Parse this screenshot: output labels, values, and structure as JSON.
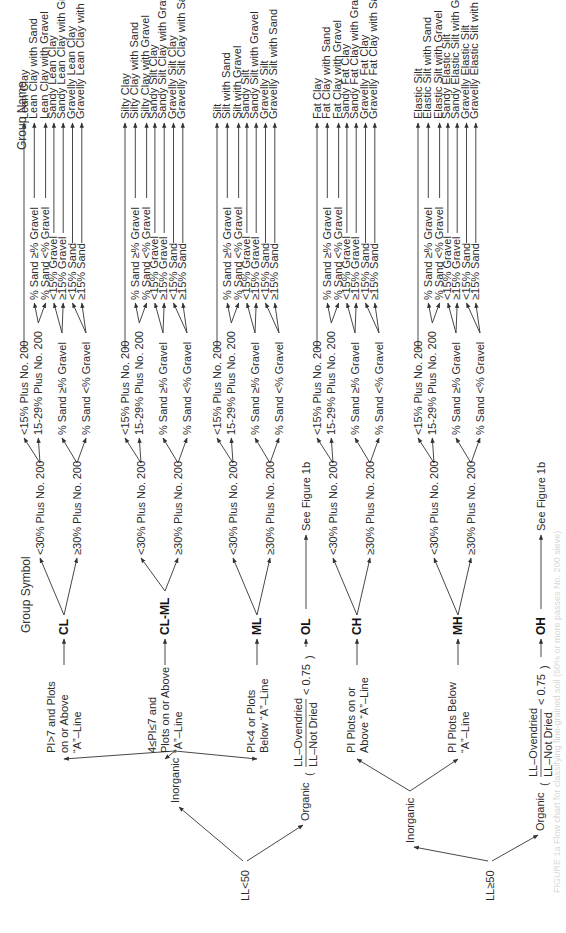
{
  "headers": {
    "group_symbol": "Group Symbol",
    "group_name": "Group Name"
  },
  "roots": [
    {
      "label": "LL<50",
      "inorganic_label": "Inorganic",
      "organic_label": "Organic",
      "organic_ratio_num": "LL–Ovendried",
      "organic_ratio_den": "LL–Not Dried",
      "organic_ratio_cmp": "< 0.75"
    },
    {
      "label": "LL≥50",
      "inorganic_label": "Inorganic",
      "organic_label": "Organic",
      "organic_ratio_num": "LL–Ovendried",
      "organic_ratio_den": "LL–Not Dried",
      "organic_ratio_cmp": "< 0.75"
    }
  ],
  "criteria": {
    "cl": [
      "PI>7 and Plots",
      "on or Above",
      "“A”–Line"
    ],
    "clml": [
      "4≤PI≤7 and",
      "Plots on or Above",
      "“A”–Line"
    ],
    "ml": [
      "PI<4 or Plots",
      "Below “A”–Line"
    ],
    "ch": [
      "PI Plots on or",
      "Above “A”–Line"
    ],
    "mh": [
      "PI Plots Below",
      "“A”–Line"
    ]
  },
  "symbols": {
    "cl": "CL",
    "clml": "CL-ML",
    "ml": "ML",
    "ol": "OL",
    "ch": "CH",
    "mh": "MH",
    "oh": "OH"
  },
  "see_figure": "See Figure 1b",
  "branch_labels": {
    "lt30": "<30% Plus No. 200",
    "ge30": "≥30% Plus No. 200",
    "lt15": "<15% Plus No. 200",
    "p15_29": "15-29% Plus No. 200",
    "sand_ge_gravel": "% Sand ≥% Gravel",
    "sand_lt_gravel": "% Sand <% Gravel",
    "lt15_gravel": "<15% Gravel",
    "ge15_gravel": "≥15% Gravel",
    "lt15_sand": "<15% Sand",
    "ge15_sand": "≥15% Sand"
  },
  "groups": [
    {
      "symbol": "CL",
      "names": [
        "Lean Clay",
        "Lean Clay with Sand",
        "Lean Clay with Gravel",
        "Sandy Lean Clay",
        "Sandy Lean Clay with Gravel",
        "Gravelly Lean Clay",
        "Gravelly Lean Clay with Sand"
      ]
    },
    {
      "symbol": "CL-ML",
      "names": [
        "Silty Clay",
        "Silty Clay with Sand",
        "Silty Clay with Gravel",
        "Sandy Silt Clay",
        "Sandy Silt Clay with Gravel",
        "Gravelly Silt Clay",
        "Gravelly Silt Clay with Sand"
      ]
    },
    {
      "symbol": "ML",
      "names": [
        "Silt",
        "Silt with Sand",
        "Silt with Gravel",
        "Sandy Silt",
        "Sandy Silt with Gravel",
        "Gravelly Silt",
        "Gravelly Silt with Sand"
      ]
    },
    {
      "symbol": "CH",
      "names": [
        "Fat Clay",
        "Fat Clay with Sand",
        "Fat Clay with Gravel",
        "Sandy Fat Clay",
        "Sandy Fat Clay with Gravel",
        "Gravelly Fat Clay",
        "Gravelly Fat Clay with Sand"
      ]
    },
    {
      "symbol": "MH",
      "names": [
        "Elastic Silt",
        "Elastic Silt with Sand",
        "Elastic Silt with Gravel",
        "Sandy Elastic Silt",
        "Sandy Elastic Silt with Gravel",
        "Gravelly Elastic Silt",
        "Gravelly Elastic Silt with Sand"
      ]
    }
  ],
  "caption": "FIGURE 1a  Flow chart for classifying fine-grained soil (50% or more passes No. 200 sieve)"
}
